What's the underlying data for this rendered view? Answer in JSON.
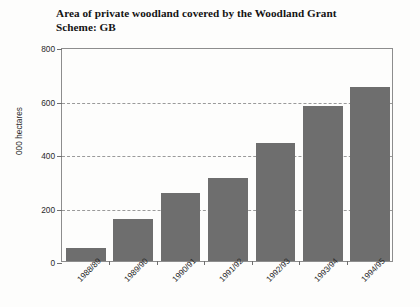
{
  "chart_data": {
    "type": "bar",
    "title": "Area of private woodland covered by the Woodland Grant Scheme: GB",
    "title_line1": "Area of private woodland covered by the Woodland Grant",
    "title_line2": "Scheme: GB",
    "xlabel": "",
    "ylabel": "000 hectares",
    "ylim": [
      0,
      800
    ],
    "yticks": [
      0,
      200,
      400,
      600,
      800
    ],
    "ytick_labels": [
      "0",
      "200",
      "400",
      "600",
      "800"
    ],
    "grid": true,
    "grid_axis": "y",
    "grid_style": "dashed",
    "legend": false,
    "categories": [
      "1988/89",
      "1989/90",
      "1990/91",
      "1991/92",
      "1992/93",
      "1993/94",
      "1994/95"
    ],
    "values": [
      50,
      157,
      255,
      312,
      440,
      578,
      650
    ],
    "bar_color": "#6e6e6e",
    "background_color": "#fdfdfc",
    "axis_color": "#8d8d8d"
  }
}
